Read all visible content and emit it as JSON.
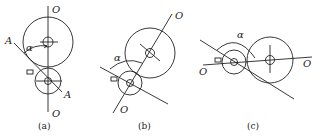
{
  "figures": [
    {
      "id": "a",
      "caption": "(a)",
      "labels": {
        "top_axis": "O",
        "bottom_axis": "O",
        "line_start": "A",
        "line_end": "A",
        "angle": "α"
      }
    },
    {
      "id": "b",
      "caption": "(b)",
      "labels": {
        "top_axis": "O",
        "bottom_axis": "O",
        "angle": "α"
      }
    },
    {
      "id": "c",
      "caption": "(c)",
      "labels": {
        "left_axis": "O",
        "right_axis": "O",
        "angle": "α"
      }
    }
  ],
  "colors": {
    "stroke": "#222222",
    "background": "#ffffff"
  }
}
